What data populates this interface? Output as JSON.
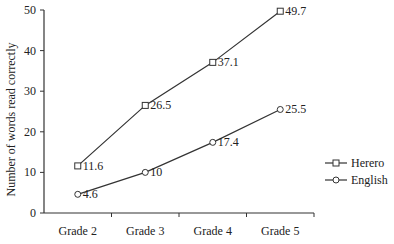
{
  "chart_data": {
    "type": "line",
    "title": "",
    "xlabel": "",
    "ylabel": "Number of words read correctly",
    "categories": [
      "Grade 2",
      "Grade 3",
      "Grade 4",
      "Grade 5"
    ],
    "series": [
      {
        "name": "Herero",
        "marker": "square",
        "values": [
          11.6,
          26.5,
          37.1,
          49.7
        ],
        "labels": [
          "11.6",
          "26.5",
          "37.1",
          "49.7"
        ]
      },
      {
        "name": "English",
        "marker": "circle",
        "values": [
          4.6,
          10,
          17.4,
          25.5
        ],
        "labels": [
          "4.6",
          "10",
          "17.4",
          "25.5"
        ]
      }
    ],
    "ylim": [
      0,
      50
    ],
    "yticks": [
      0,
      10,
      20,
      30,
      40,
      50
    ],
    "grid": false,
    "legend_position": "right"
  },
  "colors": {
    "line": "#333333",
    "text": "#222222",
    "background": "#ffffff"
  }
}
